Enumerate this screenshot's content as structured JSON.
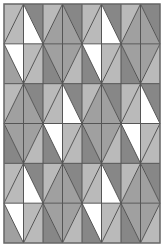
{
  "pattern": {
    "title": "Diamond triangle tiling",
    "canvas": {
      "width": 164,
      "height": 247
    },
    "frame": {
      "x": 4,
      "y": 4,
      "width": 156,
      "height": 239
    },
    "grid": {
      "cols": 8,
      "rows": 6
    },
    "colors": {
      "W": "#ffffff",
      "L": "#bababa",
      "M": "#a0a0a0",
      "D": "#878787",
      "line": "#555555",
      "border": "#666666",
      "background": "#ffffff"
    },
    "rows": [
      {
        "cells": [
          {
            "diag": "/",
            "UL": "L",
            "LR": "L"
          },
          {
            "diag": "\\",
            "LL": "W",
            "UR": "D"
          },
          {
            "diag": "/",
            "UL": "L",
            "LR": "M"
          },
          {
            "diag": "\\",
            "LL": "M",
            "UR": "D"
          },
          {
            "diag": "/",
            "UL": "L",
            "LR": "L"
          },
          {
            "diag": "\\",
            "LL": "W",
            "UR": "D"
          },
          {
            "diag": "/",
            "UL": "L",
            "LR": "M"
          },
          {
            "diag": "\\",
            "LL": "M",
            "UR": "D"
          }
        ]
      },
      {
        "cells": [
          {
            "diag": "\\",
            "UR": "W",
            "LL": "M"
          },
          {
            "diag": "/",
            "UL": "L",
            "LR": "L"
          },
          {
            "diag": "\\",
            "UR": "M",
            "LL": "D"
          },
          {
            "diag": "/",
            "UL": "M",
            "LR": "L"
          },
          {
            "diag": "\\",
            "UR": "W",
            "LL": "D"
          },
          {
            "diag": "/",
            "UL": "L",
            "LR": "L"
          },
          {
            "diag": "\\",
            "UR": "M",
            "LL": "D"
          },
          {
            "diag": "/",
            "UL": "M",
            "LR": "L"
          }
        ]
      },
      {
        "cells": [
          {
            "diag": "/",
            "UL": "L",
            "LR": "M"
          },
          {
            "diag": "\\",
            "LL": "M",
            "UR": "D"
          },
          {
            "diag": "/",
            "UL": "L",
            "LR": "L"
          },
          {
            "diag": "\\",
            "LL": "W",
            "UR": "D"
          },
          {
            "diag": "/",
            "UL": "L",
            "LR": "M"
          },
          {
            "diag": "\\",
            "LL": "M",
            "UR": "D"
          },
          {
            "diag": "/",
            "UL": "L",
            "LR": "L"
          },
          {
            "diag": "\\",
            "LL": "W",
            "UR": "D"
          }
        ]
      },
      {
        "cells": [
          {
            "diag": "\\",
            "UR": "M",
            "LL": "D"
          },
          {
            "diag": "/",
            "UL": "M",
            "LR": "L"
          },
          {
            "diag": "\\",
            "UR": "W",
            "LL": "D"
          },
          {
            "diag": "/",
            "UL": "L",
            "LR": "L"
          },
          {
            "diag": "\\",
            "UR": "M",
            "LL": "D"
          },
          {
            "diag": "/",
            "UL": "M",
            "LR": "L"
          },
          {
            "diag": "\\",
            "UR": "W",
            "LL": "D"
          },
          {
            "diag": "/",
            "UL": "L",
            "LR": "L"
          }
        ]
      },
      {
        "cells": [
          {
            "diag": "/",
            "UL": "L",
            "LR": "L"
          },
          {
            "diag": "\\",
            "LL": "W",
            "UR": "D"
          },
          {
            "diag": "/",
            "UL": "L",
            "LR": "M"
          },
          {
            "diag": "\\",
            "LL": "M",
            "UR": "D"
          },
          {
            "diag": "/",
            "UL": "L",
            "LR": "L"
          },
          {
            "diag": "\\",
            "LL": "W",
            "UR": "D"
          },
          {
            "diag": "/",
            "UL": "L",
            "LR": "M"
          },
          {
            "diag": "\\",
            "LL": "M",
            "UR": "D"
          }
        ]
      },
      {
        "cells": [
          {
            "diag": "\\",
            "UR": "W",
            "LL": "M"
          },
          {
            "diag": "/",
            "UL": "L",
            "LR": "L"
          },
          {
            "diag": "\\",
            "UR": "M",
            "LL": "D"
          },
          {
            "diag": "/",
            "UL": "M",
            "LR": "L"
          },
          {
            "diag": "\\",
            "UR": "W",
            "LL": "D"
          },
          {
            "diag": "/",
            "UL": "L",
            "LR": "L"
          },
          {
            "diag": "\\",
            "UR": "M",
            "LL": "D"
          },
          {
            "diag": "/",
            "UL": "M",
            "LR": "L"
          }
        ]
      }
    ]
  }
}
